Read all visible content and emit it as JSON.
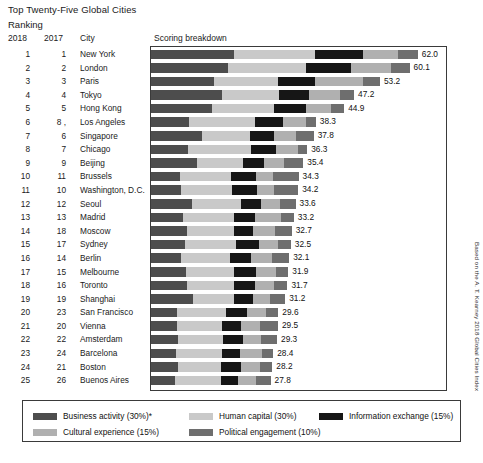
{
  "header": {
    "title": "Top Twenty-Five Global Cities",
    "subtitle": "Ranking",
    "col_2018": "2018",
    "col_2017": "2017",
    "col_city": "City",
    "col_score": "Scoring breakdown"
  },
  "source_note": "Based on the A. T. Kearney 2018 Global Cities Index",
  "colors": {
    "business_activity": "#4d4d4d",
    "human_capital": "#c9c9c9",
    "information_exchange": "#161616",
    "cultural_experience": "#b0b0b0",
    "political_engagement": "#6e6e6e",
    "plot_border": "#3a3a3a",
    "text": "#111111"
  },
  "legend": {
    "items": [
      {
        "label": "Business activity (30%)*",
        "color_key": "business_activity"
      },
      {
        "label": "Human capital (30%)",
        "color_key": "human_capital"
      },
      {
        "label": "Information exchange (15%)",
        "color_key": "information_exchange"
      },
      {
        "label": "Cultural experience (15%)",
        "color_key": "cultural_experience"
      },
      {
        "label": "Political engagement (10%)",
        "color_key": "political_engagement"
      }
    ]
  },
  "chart_data": {
    "type": "bar",
    "orientation": "horizontal",
    "stacked": true,
    "title": "Top Twenty-Five Global Cities",
    "subtitle": "Ranking",
    "xlabel": "Scoring breakdown",
    "ylabel": "City",
    "xlim": [
      0,
      66
    ],
    "grid": false,
    "legend_position": "bottom",
    "series": [
      {
        "name": "Business activity (30%)",
        "color_key": "business_activity"
      },
      {
        "name": "Human capital (30%)",
        "color_key": "human_capital"
      },
      {
        "name": "Information exchange (15%)",
        "color_key": "information_exchange"
      },
      {
        "name": "Cultural experience (15%)",
        "color_key": "cultural_experience"
      },
      {
        "name": "Political engagement (10%)",
        "color_key": "political_engagement"
      }
    ],
    "categories": [
      "New York",
      "London",
      "Paris",
      "Tokyo",
      "Hong Kong",
      "Los Angeles",
      "Singapore",
      "Chicago",
      "Beijing",
      "Brussels",
      "Washington, D.C.",
      "Seoul",
      "Madrid",
      "Moscow",
      "Sydney",
      "Berlin",
      "Melbourne",
      "Toronto",
      "Shanghai",
      "San Francisco",
      "Vienna",
      "Amsterdam",
      "Barcelona",
      "Boston",
      "Buenos Aires"
    ],
    "values": [
      62.0,
      60.1,
      53.2,
      47.2,
      44.9,
      38.3,
      37.8,
      36.3,
      35.4,
      34.3,
      34.2,
      33.6,
      33.2,
      32.7,
      32.5,
      32.1,
      31.9,
      31.7,
      31.2,
      29.6,
      29.5,
      29.3,
      28.4,
      28.2,
      27.8
    ],
    "rows": [
      {
        "rank_2018": "1",
        "rank_2017": "1",
        "city": "New York",
        "total": "62.0",
        "segments": [
          19.3,
          18.9,
          11.0,
          8.1,
          4.7
        ]
      },
      {
        "rank_2018": "2",
        "rank_2017": "2",
        "city": "London",
        "total": "60.1",
        "segments": [
          17.8,
          18.2,
          10.4,
          9.4,
          4.3
        ]
      },
      {
        "rank_2018": "3",
        "rank_2017": "3",
        "city": "Paris",
        "total": "53.2",
        "segments": [
          14.6,
          15.0,
          8.6,
          11.1,
          3.9
        ]
      },
      {
        "rank_2018": "4",
        "rank_2017": "4",
        "city": "Tokyo",
        "total": "47.2",
        "segments": [
          16.4,
          13.4,
          7.0,
          7.2,
          3.2
        ]
      },
      {
        "rank_2018": "5",
        "rank_2017": "5",
        "city": "Hong Kong",
        "total": "44.9",
        "segments": [
          14.1,
          14.6,
          7.3,
          5.9,
          3.0
        ]
      },
      {
        "rank_2018": "6",
        "rank_2017": "8 ,",
        "city": "Los Angeles",
        "total": "38.3",
        "segments": [
          8.9,
          15.3,
          6.4,
          5.4,
          2.3
        ]
      },
      {
        "rank_2018": "7",
        "rank_2017": "6",
        "city": "Singapore",
        "total": "37.8",
        "segments": [
          11.9,
          11.2,
          5.5,
          5.0,
          4.2
        ]
      },
      {
        "rank_2018": "8",
        "rank_2017": "7",
        "city": "Chicago",
        "total": "36.3",
        "segments": [
          8.7,
          14.6,
          5.7,
          5.2,
          2.1
        ]
      },
      {
        "rank_2018": "9",
        "rank_2017": "9",
        "city": "Beijing",
        "total": "35.4",
        "segments": [
          10.8,
          10.6,
          4.9,
          4.7,
          4.4
        ]
      },
      {
        "rank_2018": "10",
        "rank_2017": "11",
        "city": "Brussels",
        "total": "34.3",
        "segments": [
          6.7,
          12.0,
          5.6,
          4.1,
          5.9
        ]
      },
      {
        "rank_2018": "11",
        "rank_2017": "10",
        "city": "Washington, D.C.",
        "total": "34.2",
        "segments": [
          7.0,
          11.8,
          5.9,
          3.8,
          5.7
        ]
      },
      {
        "rank_2018": "12",
        "rank_2017": "12",
        "city": "Seoul",
        "total": "33.6",
        "segments": [
          9.6,
          11.3,
          4.7,
          4.5,
          3.5
        ]
      },
      {
        "rank_2018": "13",
        "rank_2017": "13",
        "city": "Madrid",
        "total": "33.2",
        "segments": [
          7.4,
          11.9,
          4.8,
          6.1,
          3.0
        ]
      },
      {
        "rank_2018": "14",
        "rank_2017": "18",
        "city": "Moscow",
        "total": "32.7",
        "segments": [
          8.3,
          11.0,
          4.4,
          5.2,
          3.8
        ]
      },
      {
        "rank_2018": "15",
        "rank_2017": "17",
        "city": "Sydney",
        "total": "32.5",
        "segments": [
          8.0,
          11.8,
          5.2,
          4.6,
          2.9
        ]
      },
      {
        "rank_2018": "16",
        "rank_2017": "14",
        "city": "Berlin",
        "total": "32.1",
        "segments": [
          6.9,
          11.5,
          4.9,
          4.8,
          4.0
        ]
      },
      {
        "rank_2018": "17",
        "rank_2017": "15",
        "city": "Melbourne",
        "total": "31.9",
        "segments": [
          8.1,
          11.2,
          5.0,
          4.7,
          2.9
        ]
      },
      {
        "rank_2018": "18",
        "rank_2017": "16",
        "city": "Toronto",
        "total": "31.7",
        "segments": [
          8.3,
          11.0,
          4.8,
          4.6,
          3.0
        ]
      },
      {
        "rank_2018": "19",
        "rank_2017": "19",
        "city": "Shanghai",
        "total": "31.2",
        "segments": [
          9.8,
          9.6,
          4.2,
          4.1,
          3.5
        ]
      },
      {
        "rank_2018": "20",
        "rank_2017": "23",
        "city": "San Francisco",
        "total": "29.6",
        "segments": [
          6.1,
          11.4,
          4.9,
          4.3,
          2.9
        ]
      },
      {
        "rank_2018": "21",
        "rank_2017": "20",
        "city": "Vienna",
        "total": "29.5",
        "segments": [
          6.0,
          10.4,
          4.6,
          4.3,
          4.2
        ]
      },
      {
        "rank_2018": "22",
        "rank_2017": "22",
        "city": "Amsterdam",
        "total": "29.3",
        "segments": [
          6.3,
          10.5,
          4.6,
          4.2,
          3.7
        ]
      },
      {
        "rank_2018": "23",
        "rank_2017": "24",
        "city": "Barcelona",
        "total": "28.4",
        "segments": [
          5.8,
          10.7,
          4.3,
          4.9,
          2.7
        ]
      },
      {
        "rank_2018": "24",
        "rank_2017": "21",
        "city": "Boston",
        "total": "28.2",
        "segments": [
          6.2,
          10.1,
          4.7,
          4.3,
          2.9
        ]
      },
      {
        "rank_2018": "25",
        "rank_2017": "26",
        "city": "Buenos Aires",
        "total": "27.8",
        "segments": [
          5.6,
          10.6,
          4.0,
          4.3,
          3.3
        ]
      }
    ]
  }
}
